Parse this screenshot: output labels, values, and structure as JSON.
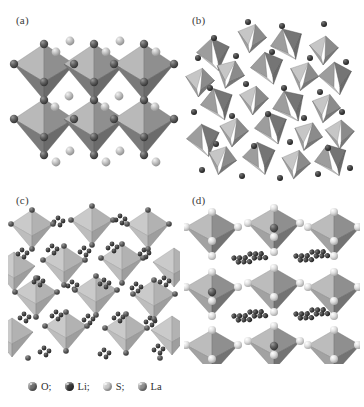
{
  "figure": {
    "background_color": "#ffffff",
    "panels": [
      {
        "id": "a",
        "label": "(a)",
        "description": "Corner-sharing octahedral framework, perovskite-like slab, 3 x 2 octahedra with interstitial spheres",
        "polyhedron_type": "octahedron",
        "rows": 2,
        "cols": 3,
        "face_colors": [
          "#6e6e6e",
          "#8d8d8d",
          "#a9a9a9",
          "#bdbdbd"
        ],
        "vertex_sphere_color": "#5c5c5c",
        "interstitial_sphere_color": "#b9b9b9"
      },
      {
        "id": "b",
        "label": "(b)",
        "description": "Disordered dense polyhedral network with isolated spheres",
        "polyhedron_type": "mixed-polyhedra",
        "face_colors": [
          "#6a6a6a",
          "#808080",
          "#9a9a9a",
          "#b4b4b4",
          "#c8c8c8"
        ],
        "vertex_sphere_color": "#3f3f3f",
        "interstitial_sphere_color": "#4a4a4a"
      },
      {
        "id": "c",
        "label": "(c)",
        "description": "Light-toned polyhedra separated by dense clusters of small dark spheres",
        "polyhedron_type": "octahedron",
        "rows": 4,
        "cols": 4,
        "face_colors": [
          "#b6b6b6",
          "#c4c4c4",
          "#cfcfcf",
          "#a2a2a2"
        ],
        "vertex_sphere_color": "#5a5a5a",
        "interstitial_sphere_color": "#6b6b6b"
      },
      {
        "id": "d",
        "label": "(d)",
        "description": "Layered octahedra with pale vertex spheres and diagonal chains of dark lithium clusters",
        "polyhedron_type": "octahedron",
        "rows": 3,
        "cols": 3,
        "face_colors": [
          "#707070",
          "#8a8a8a",
          "#a4a4a4",
          "#bcbcbc"
        ],
        "vertex_sphere_color": "#dcdcdc",
        "interstitial_sphere_color": "#3c3c3c"
      }
    ]
  },
  "legend": {
    "items": [
      {
        "name": "O",
        "label": "O;",
        "color": "#707070"
      },
      {
        "name": "Li",
        "label": "Li;",
        "color": "#3a3a3a"
      },
      {
        "name": "S",
        "label": "S;",
        "color": "#c9c9c9"
      },
      {
        "name": "La",
        "label": "La",
        "color": "#8f8f8f"
      }
    ]
  }
}
